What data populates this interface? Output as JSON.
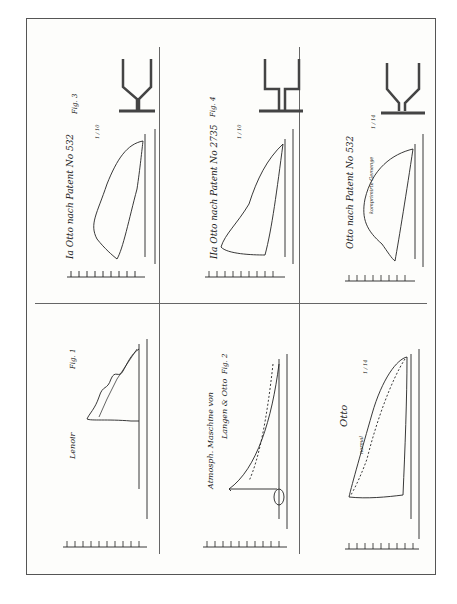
{
  "plate": {
    "orientation": "rotated 90deg counter-clockwise",
    "panels": [
      {
        "id": "fig1",
        "position": "bottom-left",
        "title": "Lenoir",
        "fig_label": "Fig. 1",
        "y_ticks": [
          "10",
          "9",
          "8",
          "7",
          "6",
          "5",
          "4",
          "3",
          "2",
          "1",
          "0"
        ]
      },
      {
        "id": "fig2",
        "position": "bottom-middle",
        "title_line1": "Atmosph. Maschine von",
        "title_line2": "Langen & Otto",
        "fig_label": "Fig. 2",
        "y_ticks": [
          "10",
          "9",
          "8",
          "7",
          "6",
          "5",
          "4",
          "3",
          "2",
          "1",
          "0"
        ]
      },
      {
        "id": "fig_otto_normal",
        "position": "bottom-right",
        "title": "Otto",
        "subtitle": "normal",
        "scale_label": "1 / 14",
        "y_ticks": [
          "10",
          "9",
          "8",
          "7",
          "6",
          "5",
          "4",
          "3",
          "2",
          "1",
          "0"
        ]
      },
      {
        "id": "fig3",
        "position": "top-left",
        "title": "Ia Otto nach Patent No 532",
        "fig_label": "Fig. 3",
        "scale_label": "1 / 10",
        "y_ticks": [
          "8",
          "7",
          "6",
          "5",
          "4",
          "3",
          "2",
          "1",
          "0"
        ]
      },
      {
        "id": "fig4",
        "position": "top-middle",
        "title": "IIa Otto nach Patent No 2735",
        "fig_label": "Fig. 4",
        "scale_label": "1 / 10",
        "y_ticks": [
          "8",
          "7",
          "6",
          "5",
          "4",
          "3",
          "2",
          "1",
          "0"
        ]
      },
      {
        "id": "fig_otto_532",
        "position": "top-right",
        "title": "Otto nach Patent No 532",
        "subtitle": "komprimirte Gemenge",
        "scale_label": "1 / 14",
        "y_ticks": [
          "8",
          "7",
          "6",
          "5",
          "4",
          "3",
          "2",
          "1",
          "0"
        ]
      }
    ]
  }
}
